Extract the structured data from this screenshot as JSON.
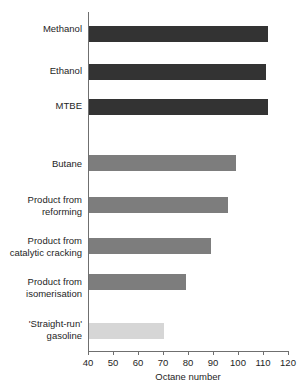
{
  "chart_data": {
    "type": "bar",
    "orientation": "horizontal",
    "title": "",
    "subtitle": "",
    "xlabel": "Octane number",
    "ylabel": "",
    "xlim": [
      40,
      120
    ],
    "xticks": [
      40,
      50,
      60,
      70,
      80,
      90,
      100,
      110,
      120
    ],
    "xtick_labels": [
      "40",
      "50",
      "60",
      "70",
      "80",
      "90",
      "100",
      "110",
      "120"
    ],
    "grid": false,
    "legend": null,
    "categories": [
      "Methanol",
      "Ethanol",
      "MTBE",
      "Butane",
      "Product from reforming",
      "Product from catalytic cracking",
      "Product from isomerisation",
      "'Straight-run' gasoline"
    ],
    "values": [
      112,
      111,
      112,
      99,
      96,
      89,
      79,
      70
    ],
    "bar_colors": [
      "#333333",
      "#333333",
      "#333333",
      "#7d7d7d",
      "#7d7d7d",
      "#7d7d7d",
      "#7d7d7d",
      "#d6d6d6"
    ],
    "bars": [
      {
        "label_line1": "Methanol",
        "label_line2": "",
        "value": 112,
        "color": "#333333",
        "shade": "dark"
      },
      {
        "label_line1": "Ethanol",
        "label_line2": "",
        "value": 111,
        "color": "#333333",
        "shade": "dark"
      },
      {
        "label_line1": "MTBE",
        "label_line2": "",
        "value": 112,
        "color": "#333333",
        "shade": "dark"
      },
      {
        "label_line1": "Butane",
        "label_line2": "",
        "value": 99,
        "color": "#7d7d7d",
        "shade": "medium"
      },
      {
        "label_line1": "Product from",
        "label_line2": "reforming",
        "value": 96,
        "color": "#7d7d7d",
        "shade": "medium"
      },
      {
        "label_line1": "Product from",
        "label_line2": "catalytic cracking",
        "value": 89,
        "color": "#7d7d7d",
        "shade": "medium"
      },
      {
        "label_line1": "Product from",
        "label_line2": "isomerisation",
        "value": 79,
        "color": "#7d7d7d",
        "shade": "medium"
      },
      {
        "label_line1": "'Straight-run'",
        "label_line2": "gasoline",
        "value": 70,
        "color": "#d6d6d6",
        "shade": "light"
      }
    ]
  },
  "axis": {
    "x_title": "Octane number",
    "ticks": [
      {
        "value": "40"
      },
      {
        "value": "50"
      },
      {
        "value": "60"
      },
      {
        "value": "70"
      },
      {
        "value": "80"
      },
      {
        "value": "90"
      },
      {
        "value": "100"
      },
      {
        "value": "110"
      },
      {
        "value": "120"
      }
    ]
  },
  "colors": {
    "bar_dark": "#333333",
    "bar_medium": "#7d7d7d",
    "bar_light": "#d6d6d6",
    "axis": "#6f6f6f",
    "text": "#1e1e1e",
    "background": "#ffffff"
  }
}
